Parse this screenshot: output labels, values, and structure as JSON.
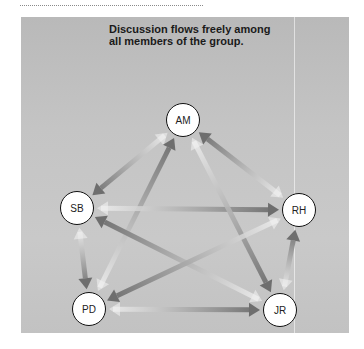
{
  "title": {
    "line1": "Discussion flows freely among",
    "line2": "all members of the group."
  },
  "nodes": [
    {
      "id": "AM",
      "label": "AM",
      "x": 183,
      "y": 120
    },
    {
      "id": "SB",
      "label": "SB",
      "x": 77,
      "y": 208
    },
    {
      "id": "RH",
      "label": "RH",
      "x": 299,
      "y": 210
    },
    {
      "id": "PD",
      "label": "PD",
      "x": 89,
      "y": 309
    },
    {
      "id": "JR",
      "label": "JR",
      "x": 280,
      "y": 310
    }
  ],
  "flows": [
    {
      "from": "RH",
      "to": "AM"
    },
    {
      "from": "AM",
      "to": "SB"
    },
    {
      "from": "PD",
      "to": "AM"
    },
    {
      "from": "SB",
      "to": "RH"
    },
    {
      "from": "AM",
      "to": "JR"
    },
    {
      "from": "JR",
      "to": "SB"
    },
    {
      "from": "RH",
      "to": "PD"
    },
    {
      "from": "SB",
      "to": "PD"
    },
    {
      "from": "PD",
      "to": "JR"
    },
    {
      "from": "JR",
      "to": "RH"
    }
  ],
  "colors": {
    "panel": "#c4c4c4",
    "arrow_head": "#6e6e6e",
    "arrow_tail": "#f0f0f0",
    "node_fill": "#ffffff",
    "node_border": "#111111"
  }
}
